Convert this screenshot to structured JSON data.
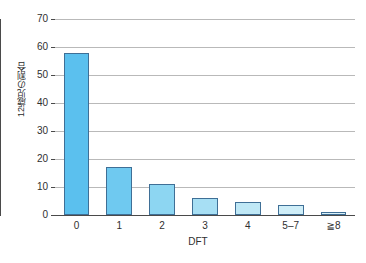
{
  "chart_data": {
    "type": "bar",
    "title": "",
    "subtitle": "",
    "xlabel": "DFT",
    "ylabel": "12歳児の割合",
    "categories": [
      "0",
      "1",
      "2",
      "3",
      "4",
      "5–7",
      "≧8"
    ],
    "values": [
      58,
      17,
      11,
      6,
      4.5,
      3.5,
      1
    ],
    "ylim": [
      0,
      70
    ],
    "yticks": [
      0,
      10,
      20,
      30,
      40,
      50,
      60,
      70
    ],
    "ytick_labels": [
      "0",
      "10",
      "20",
      "30",
      "40",
      "50",
      "60",
      "70"
    ],
    "grid": "horizontal",
    "legend": "none",
    "bar_colors": [
      "#5BC0EE",
      "#6FC9F0",
      "#8DD6F2",
      "#A7DFF4",
      "#BFE8F6",
      "#CFEEF8",
      "#D9F1F9"
    ],
    "bar_border_color": "#3F6F96",
    "axis_color": "#4A4A4A",
    "grid_color": "#B9B9B9",
    "background": "#FFFFFF"
  }
}
